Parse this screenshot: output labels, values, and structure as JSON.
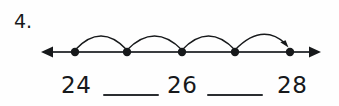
{
  "problem": {
    "number_label": "4.",
    "ink_color": "#17191b",
    "background_color": "#fefefe"
  },
  "number_line": {
    "left_arrow_label": "left-arrowhead",
    "right_arrow_label": "right-arrowhead",
    "axis_y": 52,
    "axis_start_x": 42,
    "axis_end_x": 320,
    "tick_points": [
      {
        "x": 75,
        "label": "point-1"
      },
      {
        "x": 127,
        "label": "point-2"
      },
      {
        "x": 182,
        "label": "point-3"
      },
      {
        "x": 235,
        "label": "point-4"
      },
      {
        "x": 290,
        "label": "point-5"
      }
    ],
    "jump_arcs": [
      {
        "from_x": 75,
        "to_x": 127,
        "peak_y": 31,
        "has_arrowhead": false
      },
      {
        "from_x": 127,
        "to_x": 182,
        "peak_y": 31,
        "has_arrowhead": false
      },
      {
        "from_x": 182,
        "to_x": 235,
        "peak_y": 31,
        "has_arrowhead": false
      },
      {
        "from_x": 235,
        "to_x": 290,
        "peak_y": 31,
        "has_arrowhead": true
      }
    ]
  },
  "answers": {
    "numbers": [
      {
        "value": "24"
      },
      {
        "value": "26"
      },
      {
        "value": "28"
      }
    ],
    "blanks": [
      {
        "value": ""
      },
      {
        "value": ""
      }
    ]
  }
}
